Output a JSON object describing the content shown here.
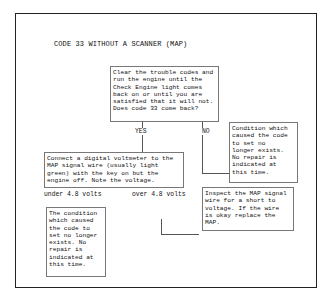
{
  "title": "CODE 33 WITHOUT A SCANNER (MAP)",
  "nodes": {
    "start": "Clear the trouble codes and\nrun the engine until the\nCheck Engine light comes\nback on or until you are\nsatisfied that it will not.\nDoes code 33 come back?",
    "no_result": "Condition which\ncaused the code\nto set no\nlonger exists.\nNo repair is\nindicated at\nthis time.",
    "voltmeter": "Connect a digital voltmeter to the\nMAP signal wire (usually light\ngreen) with the key on but the\nengine off. Note the voltage.",
    "under_result": "The condition\nwhich caused\nthe code to\nset no longer\nexists. No\nrepair is\nindicated at\nthis time.",
    "over_result": "Inspect the MAP signal\nwire for a short to\nvoltage. If the wire\nis okay replace the\nMAP."
  },
  "edges": {
    "yes": "YES",
    "no": "NO",
    "under": "under 4.8 volts",
    "over": "over 4.8 volts"
  }
}
